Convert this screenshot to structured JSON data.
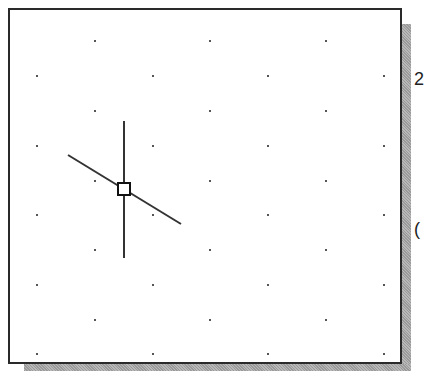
{
  "canvas": {
    "name": "drawing-area",
    "background": "#ffffff",
    "border_color": "#2a2a2a",
    "grid": {
      "dot_color": "#555555",
      "rows_y": [
        41,
        76,
        111,
        146,
        181,
        215,
        250,
        285,
        320,
        354
      ],
      "cols_x": [
        37,
        95,
        153,
        210,
        268,
        326,
        384
      ]
    },
    "cursor": {
      "type": "crosshair-with-pickbox",
      "center": [
        124,
        189
      ],
      "pickbox_size": 12,
      "vertical": {
        "x": 124,
        "y1": 121,
        "y2": 258
      },
      "diagonal": {
        "x1": 68,
        "y1": 155,
        "x2": 181,
        "y2": 224
      },
      "color": "#333333"
    }
  },
  "edge_glyphs": [
    {
      "text": "2",
      "x": 414,
      "y": 79
    },
    {
      "text": "(",
      "x": 414,
      "y": 229
    }
  ]
}
